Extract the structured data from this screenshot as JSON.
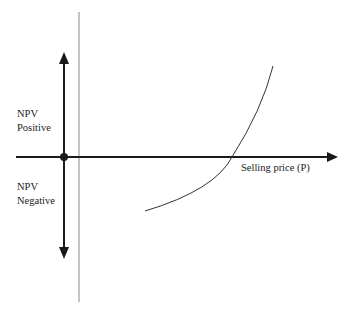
{
  "diagram": {
    "labels": {
      "npv_positive_line1": "NPV",
      "npv_positive_line2": "Positive",
      "npv_negative_line1": "NPV",
      "npv_negative_line2": "Negative",
      "x_axis": "Selling price (P)"
    },
    "colors": {
      "axis": "#1a1a1a",
      "reference_line": "#888888",
      "curve": "#333333",
      "text": "#222222"
    }
  }
}
